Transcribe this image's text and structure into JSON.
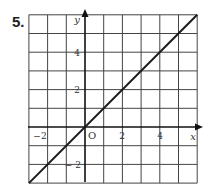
{
  "problem": {
    "number": "5."
  },
  "chart_data": {
    "type": "line",
    "title": "",
    "xlabel": "x",
    "ylabel": "y",
    "xlim": [
      -3,
      6
    ],
    "ylim": [
      -3,
      6
    ],
    "grid": true,
    "grid_step": 1,
    "x_ticks": [
      -2,
      2,
      4
    ],
    "y_ticks": [
      4,
      2,
      -2
    ],
    "origin_label": "O",
    "series": [
      {
        "name": "y = x",
        "x": [
          -3,
          6
        ],
        "y": [
          -3,
          6
        ]
      }
    ]
  },
  "labels": {
    "x_axis": "x",
    "y_axis": "y",
    "origin": "O",
    "xt_m2": "−2",
    "xt_2": "2",
    "xt_4": "4",
    "yt_4": "4",
    "yt_2": "2",
    "yt_m2": "− 2"
  },
  "colors": {
    "grid": "#333333",
    "line": "#1a1a1a",
    "background": "#ffffff"
  }
}
